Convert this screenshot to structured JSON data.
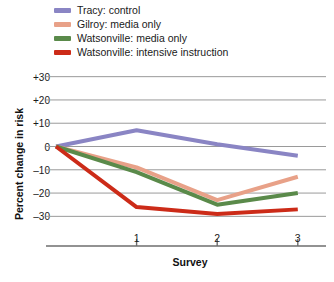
{
  "legend": {
    "position": "top-left",
    "items": [
      {
        "label": "Tracy: control",
        "color": "#8a85c4",
        "swatch_name": "legend-swatch-tracy-control"
      },
      {
        "label": "Gilroy: media only",
        "color": "#e8a188",
        "swatch_name": "legend-swatch-gilroy-media-only"
      },
      {
        "label": "Watsonville: media only",
        "color": "#5a8a4a",
        "swatch_name": "legend-swatch-watsonville-media-only"
      },
      {
        "label": "Watsonville: intensive instruction",
        "color": "#cc2b18",
        "swatch_name": "legend-swatch-watsonville-intensive-instruction"
      }
    ]
  },
  "axes": {
    "ylabel": "Percent change in risk",
    "xlabel": "Survey",
    "yticks": [
      "+30",
      "+20",
      "+10",
      "0",
      "–10",
      "–20",
      "–30"
    ],
    "ytick_values": [
      30,
      20,
      10,
      0,
      -10,
      -20,
      -30
    ],
    "xticks": [
      "1",
      "2",
      "3"
    ],
    "xtick_values": [
      1,
      2,
      3
    ]
  },
  "chart_data": {
    "type": "line",
    "title": "",
    "xlabel": "Survey",
    "ylabel": "Percent change in risk",
    "x": [
      0,
      1,
      2,
      3
    ],
    "categories": [
      "0",
      "1",
      "2",
      "3"
    ],
    "xlim": [
      0,
      3.35
    ],
    "ylim": [
      -35,
      32
    ],
    "grid": true,
    "grid_axis": "y",
    "legend_position": "top-left",
    "series": [
      {
        "name": "Tracy: control",
        "color": "#8a85c4",
        "values": [
          0,
          7,
          1,
          -4
        ]
      },
      {
        "name": "Gilroy: media only",
        "color": "#e8a188",
        "values": [
          0,
          -9,
          -23,
          -13
        ]
      },
      {
        "name": "Watsonville: media only",
        "color": "#5a8a4a",
        "values": [
          0,
          -11,
          -25,
          -20
        ]
      },
      {
        "name": "Watsonville: intensive instruction",
        "color": "#cc2b18",
        "values": [
          0,
          -26,
          -29,
          -27
        ]
      }
    ]
  },
  "style": {
    "grid_color": "#9a9a9a",
    "axis_color": "#6e6e6e",
    "text_color": "#1a1a1a",
    "background": "#ffffff",
    "line_width": 4
  }
}
